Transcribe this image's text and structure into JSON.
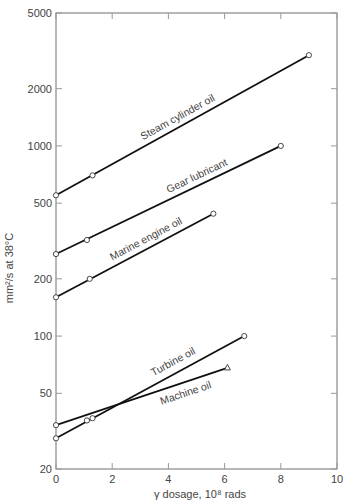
{
  "chart_data": {
    "type": "line",
    "title": "",
    "xlabel": "γ dosage, 10⁸ rads",
    "ylabel": "mm²/s at 38°C",
    "xlim": [
      0,
      10
    ],
    "ylim": [
      20,
      5000
    ],
    "yscale": "log",
    "x_ticks": [
      0,
      2,
      4,
      6,
      8,
      10
    ],
    "y_ticks": [
      20,
      50,
      100,
      200,
      500,
      1000,
      2000,
      5000
    ],
    "grid": false,
    "legend": "inline labels",
    "series": [
      {
        "name": "Steam cylinder oil",
        "marker": "circle",
        "x": [
          0,
          1.3,
          9.0
        ],
        "y": [
          550,
          700,
          3000
        ],
        "label_x": 3.2,
        "label_dy": -6
      },
      {
        "name": "Gear lubricant",
        "marker": "circle",
        "x": [
          0,
          1.1,
          8.0
        ],
        "y": [
          270,
          320,
          1000
        ],
        "label_x": 4.1,
        "label_dy": -6
      },
      {
        "name": "Marine engine oil",
        "marker": "circle",
        "x": [
          0,
          1.2,
          5.6
        ],
        "y": [
          160,
          200,
          440
        ],
        "label_x": 2.1,
        "label_dy": -6
      },
      {
        "name": "Turbine oil",
        "marker": "circle",
        "x": [
          0,
          1.3,
          6.7
        ],
        "y": [
          29,
          37,
          100
        ],
        "label_x": 3.6,
        "label_dy": -8
      },
      {
        "name": "Machine oil",
        "marker": "triangle",
        "x": [
          0,
          1.1,
          6.1
        ],
        "y": [
          34,
          36,
          68
        ],
        "label_x": 3.6,
        "label_dy": 14
      }
    ]
  }
}
